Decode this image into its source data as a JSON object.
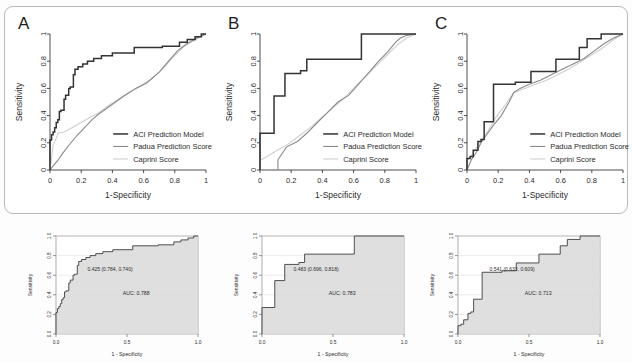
{
  "figure": {
    "panels": [
      {
        "letter": "A",
        "auc_label": "AUC: 0.788",
        "cutpoint_label": "0.425 (0.784, 0.740)"
      },
      {
        "letter": "B",
        "auc_label": "AUC: 0.783",
        "cutpoint_label": "0.483 (0.696, 0.818)"
      },
      {
        "letter": "C",
        "auc_label": "AUC: 0.713",
        "cutpoint_label": "0.541 (0.633, 0.609)"
      }
    ]
  },
  "axes": {
    "x_label_top": "1-Specificity",
    "y_label_top": "Sensitivity",
    "x_label_bottom": "1 - Specificity",
    "y_label_bottom": "Sensitivity",
    "x_ticks_top": [
      "0",
      "0.2",
      "0.4",
      "0.6",
      "0.8",
      "1"
    ],
    "y_ticks_top": [
      "0",
      "0.2",
      "0.4",
      "0.6",
      "0.8",
      "1"
    ],
    "x_ticks_bottom": [
      "0.0",
      "0.5",
      "1.0"
    ],
    "y_ticks_bottom": [
      "0.0",
      "0.2",
      "0.4",
      "0.6",
      "0.8",
      "1.0"
    ]
  },
  "legend": {
    "entries": [
      {
        "label": "ACI Prediction Model",
        "color": "#333333"
      },
      {
        "label": "Padua Prediction Score",
        "color": "#8a8a8a"
      },
      {
        "label": "Caprini Score",
        "color": "#cfcfcf"
      }
    ]
  },
  "colors": {
    "aci": "#333333",
    "padua": "#8a8a8a",
    "caprini": "#cfcfcf",
    "axis": "#3a3a3a",
    "grid": "#e3e3e3",
    "fill": "#d9d9d9",
    "frame": "#b9b9b9"
  },
  "chart_data": [
    {
      "type": "line",
      "title": "A",
      "xlabel": "1-Specificity",
      "ylabel": "Sensitivity",
      "xlim": [
        0,
        1
      ],
      "ylim": [
        0,
        1
      ],
      "grid": false,
      "legend_position": "bottom-right",
      "auc": 0.788,
      "optimal_cutpoint": {
        "threshold": 0.425,
        "specificity": 0.784,
        "sensitivity": 0.74
      },
      "series": [
        {
          "name": "ACI Prediction Model",
          "x": [
            0,
            0,
            0.01,
            0.01,
            0.02,
            0.02,
            0.03,
            0.03,
            0.04,
            0.04,
            0.05,
            0.05,
            0.06,
            0.06,
            0.07,
            0.07,
            0.09,
            0.09,
            0.1,
            0.1,
            0.12,
            0.12,
            0.13,
            0.13,
            0.15,
            0.15,
            0.16,
            0.16,
            0.18,
            0.18,
            0.21,
            0.21,
            0.24,
            0.24,
            0.28,
            0.28,
            0.33,
            0.33,
            0.4,
            0.4,
            0.54,
            0.54,
            0.72,
            0.72,
            0.83,
            0.83,
            0.88,
            0.88,
            0.93,
            0.93,
            0.97,
            0.97,
            1.0
          ],
          "y": [
            0,
            0.22,
            0.22,
            0.26,
            0.26,
            0.28,
            0.28,
            0.31,
            0.31,
            0.35,
            0.35,
            0.37,
            0.37,
            0.43,
            0.43,
            0.44,
            0.44,
            0.52,
            0.52,
            0.55,
            0.55,
            0.6,
            0.6,
            0.61,
            0.61,
            0.7,
            0.7,
            0.74,
            0.74,
            0.76,
            0.76,
            0.78,
            0.78,
            0.8,
            0.8,
            0.82,
            0.82,
            0.84,
            0.84,
            0.86,
            0.86,
            0.9,
            0.9,
            0.91,
            0.91,
            0.94,
            0.94,
            0.96,
            0.96,
            0.98,
            0.98,
            1.0,
            1.0
          ]
        },
        {
          "name": "Padua Prediction Score",
          "x": [
            0,
            0.02,
            0.05,
            0.08,
            0.12,
            0.17,
            0.22,
            0.27,
            0.31,
            0.36,
            0.42,
            0.48,
            0.55,
            0.62,
            0.7,
            0.76,
            0.82,
            0.88,
            0.94,
            1.0
          ],
          "y": [
            0,
            0.03,
            0.07,
            0.12,
            0.18,
            0.25,
            0.31,
            0.37,
            0.41,
            0.45,
            0.5,
            0.55,
            0.6,
            0.64,
            0.72,
            0.8,
            0.88,
            0.93,
            0.97,
            1.0
          ]
        },
        {
          "name": "Caprini Score",
          "x": [
            0,
            0.02,
            0.05,
            0.05,
            0.09,
            0.14,
            0.2,
            0.26,
            0.31,
            0.37,
            0.44,
            0.51,
            0.58,
            0.65,
            0.72,
            0.79,
            0.86,
            0.92,
            1.0
          ],
          "y": [
            0,
            0.18,
            0.26,
            0.27,
            0.28,
            0.31,
            0.35,
            0.39,
            0.42,
            0.47,
            0.52,
            0.57,
            0.62,
            0.67,
            0.74,
            0.83,
            0.91,
            0.95,
            1.0
          ]
        }
      ]
    },
    {
      "type": "line",
      "title": "B",
      "xlabel": "1-Specificity",
      "ylabel": "Sensitivity",
      "xlim": [
        0,
        1
      ],
      "ylim": [
        0,
        1
      ],
      "grid": false,
      "legend_position": "bottom-right",
      "auc": 0.783,
      "optimal_cutpoint": {
        "threshold": 0.483,
        "specificity": 0.696,
        "sensitivity": 0.818
      },
      "series": [
        {
          "name": "ACI Prediction Model",
          "x": [
            0,
            0,
            0.09,
            0.09,
            0.16,
            0.16,
            0.26,
            0.26,
            0.3,
            0.3,
            0.65,
            0.65,
            0.9,
            0.9,
            1.0
          ],
          "y": [
            0,
            0.27,
            0.27,
            0.545,
            0.545,
            0.71,
            0.71,
            0.73,
            0.73,
            0.815,
            0.815,
            1.0,
            1.0,
            1.0,
            1.0
          ]
        },
        {
          "name": "Padua Prediction Score",
          "x": [
            0.115,
            0.115,
            0.17,
            0.24,
            0.3,
            0.36,
            0.43,
            0.5,
            0.57,
            0.63,
            0.7,
            0.76,
            0.82,
            0.87,
            0.9,
            0.94,
            1.0
          ],
          "y": [
            0,
            0.075,
            0.17,
            0.21,
            0.27,
            0.34,
            0.42,
            0.5,
            0.55,
            0.63,
            0.72,
            0.8,
            0.87,
            0.94,
            0.97,
            0.99,
            1.0
          ]
        },
        {
          "name": "Caprini Score",
          "x": [
            0,
            0.06,
            0.12,
            0.18,
            0.25,
            0.32,
            0.39,
            0.46,
            0.53,
            0.6,
            0.67,
            0.74,
            0.81,
            0.88,
            0.94,
            1.0
          ],
          "y": [
            0.07,
            0.11,
            0.15,
            0.19,
            0.25,
            0.31,
            0.38,
            0.45,
            0.52,
            0.6,
            0.68,
            0.76,
            0.84,
            0.92,
            0.97,
            1.0
          ]
        }
      ]
    },
    {
      "type": "line",
      "title": "C",
      "xlabel": "1-Specificity",
      "ylabel": "Sensitivity",
      "xlim": [
        0,
        1
      ],
      "ylim": [
        0,
        1
      ],
      "grid": false,
      "legend_position": "bottom-right",
      "auc": 0.713,
      "optimal_cutpoint": {
        "threshold": 0.541,
        "specificity": 0.633,
        "sensitivity": 0.609
      },
      "series": [
        {
          "name": "ACI Prediction Model",
          "x": [
            0,
            0,
            0.02,
            0.02,
            0.04,
            0.04,
            0.07,
            0.07,
            0.09,
            0.09,
            0.11,
            0.11,
            0.17,
            0.17,
            0.31,
            0.31,
            0.41,
            0.41,
            0.57,
            0.57,
            0.72,
            0.72,
            0.77,
            0.77,
            0.86,
            0.86,
            1.0
          ],
          "y": [
            0,
            0.085,
            0.085,
            0.1,
            0.1,
            0.145,
            0.145,
            0.21,
            0.21,
            0.225,
            0.225,
            0.355,
            0.355,
            0.63,
            0.63,
            0.645,
            0.645,
            0.725,
            0.725,
            0.815,
            0.815,
            0.9,
            0.9,
            0.965,
            0.965,
            1.0,
            1.0
          ]
        },
        {
          "name": "Padua Prediction Score",
          "x": [
            0,
            0.03,
            0.06,
            0.09,
            0.12,
            0.17,
            0.22,
            0.27,
            0.3,
            0.34,
            0.4,
            0.47,
            0.54,
            0.61,
            0.68,
            0.75,
            0.82,
            0.88,
            0.94,
            1.0
          ],
          "y": [
            0,
            0.08,
            0.13,
            0.2,
            0.25,
            0.33,
            0.4,
            0.5,
            0.57,
            0.6,
            0.63,
            0.66,
            0.7,
            0.74,
            0.78,
            0.82,
            0.88,
            0.93,
            0.97,
            1.0
          ]
        },
        {
          "name": "Caprini Score",
          "x": [
            0,
            0.03,
            0.06,
            0.09,
            0.13,
            0.18,
            0.24,
            0.3,
            0.37,
            0.44,
            0.51,
            0.58,
            0.65,
            0.72,
            0.79,
            0.86,
            0.93,
            1.0
          ],
          "y": [
            0.065,
            0.11,
            0.16,
            0.21,
            0.28,
            0.38,
            0.47,
            0.57,
            0.6,
            0.63,
            0.66,
            0.7,
            0.74,
            0.79,
            0.84,
            0.89,
            0.95,
            1.0
          ]
        }
      ]
    }
  ]
}
